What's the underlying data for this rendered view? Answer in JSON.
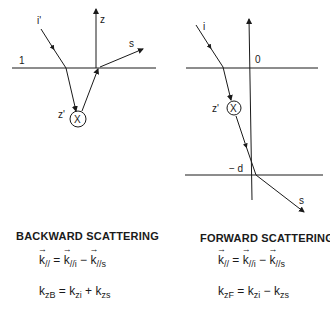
{
  "backward": {
    "labels": {
      "incident": "i'",
      "axis": "z",
      "scattered": "s",
      "medium": "1",
      "depth": "z'",
      "scatterer": "X"
    },
    "title": "BACKWARD SCATTERING",
    "eq1": {
      "lhs": "k",
      "lhs_sub": "//",
      "mid": "k",
      "mid_sub": "//i",
      "rhs": "k",
      "rhs_sub": "//s",
      "eq": "=",
      "op": "−"
    },
    "eq2": {
      "lhs": "k",
      "lhs_sub": "zB",
      "mid": "k",
      "mid_sub": "zi",
      "rhs": "k",
      "rhs_sub": "zs",
      "eq": "=",
      "op": "+"
    }
  },
  "forward": {
    "labels": {
      "incident": "i",
      "origin": "0",
      "scattered": "s",
      "depth": "z'",
      "scatterer": "X",
      "bottom": "− d"
    },
    "title": "FORWARD SCATTERING",
    "eq1": {
      "lhs": "k",
      "lhs_sub": "//",
      "mid": "k",
      "mid_sub": "//i",
      "rhs": "k",
      "rhs_sub": "//s",
      "eq": "=",
      "op": "−"
    },
    "eq2": {
      "lhs": "k",
      "lhs_sub": "zF",
      "mid": "k",
      "mid_sub": "zi",
      "rhs": "k",
      "rhs_sub": "zs",
      "eq": "=",
      "op": "−"
    }
  }
}
